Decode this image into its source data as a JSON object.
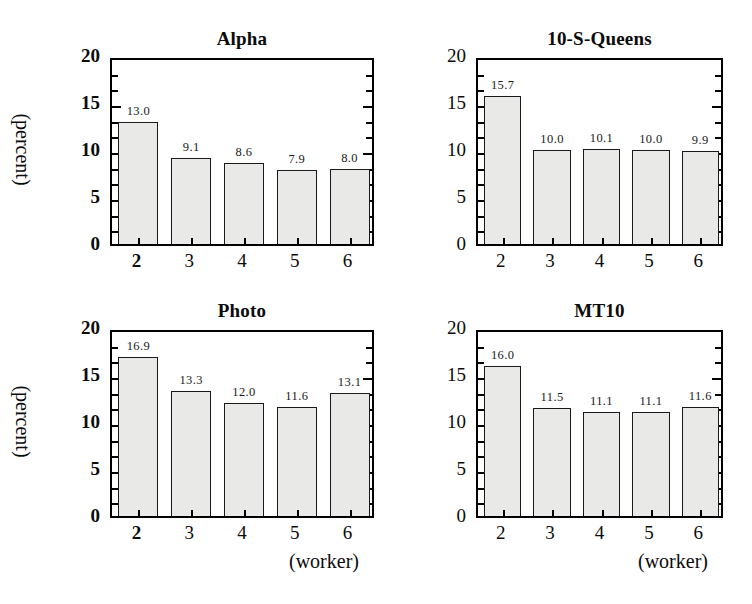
{
  "figure": {
    "background": "#ffffff",
    "bar_fill": "#e9e9e7",
    "bar_stroke": "#1a1a1a",
    "frame_color": "#000000",
    "text_color": "#0b0b0b"
  },
  "axis": {
    "y_title": "(percent)",
    "x_title": "(worker)",
    "y_ticks": [
      "0",
      "5",
      "10",
      "15",
      "20"
    ],
    "y_min": 0,
    "y_max": 20,
    "x_ticks": [
      "2",
      "3",
      "4",
      "5",
      "6"
    ]
  },
  "chart_data": [
    {
      "type": "bar",
      "title": "Alpha",
      "xlabel": "(worker)",
      "ylabel": "(percent)",
      "categories": [
        "2",
        "3",
        "4",
        "5",
        "6"
      ],
      "values": [
        13.0,
        9.1,
        8.6,
        7.9,
        8.0
      ],
      "labels": [
        "13.0",
        "9.1",
        "8.6",
        "7.9",
        "8.0"
      ],
      "ylim": [
        0,
        20
      ],
      "yticks": [
        0,
        5,
        10,
        15,
        20
      ],
      "grid": false,
      "legend": "none",
      "bold_xticks": [
        "2"
      ],
      "bold_yticks": true
    },
    {
      "type": "bar",
      "title": "10-S-Queens",
      "xlabel": "(worker)",
      "ylabel": "(percent)",
      "categories": [
        "2",
        "3",
        "4",
        "5",
        "6"
      ],
      "values": [
        15.7,
        10.0,
        10.1,
        10.0,
        9.9
      ],
      "labels": [
        "15.7",
        "10.0",
        "10.1",
        "10.0",
        "9.9"
      ],
      "ylim": [
        0,
        20
      ],
      "yticks": [
        0,
        5,
        10,
        15,
        20
      ],
      "grid": false,
      "legend": "none",
      "bold_xticks": [],
      "bold_yticks": false
    },
    {
      "type": "bar",
      "title": "Photo",
      "xlabel": "(worker)",
      "ylabel": "(percent)",
      "categories": [
        "2",
        "3",
        "4",
        "5",
        "6"
      ],
      "values": [
        16.9,
        13.3,
        12.0,
        11.6,
        13.1
      ],
      "labels": [
        "16.9",
        "13.3",
        "12.0",
        "11.6",
        "13.1"
      ],
      "ylim": [
        0,
        20
      ],
      "yticks": [
        0,
        5,
        10,
        15,
        20
      ],
      "grid": false,
      "legend": "none",
      "bold_xticks": [
        "2"
      ],
      "bold_yticks": true
    },
    {
      "type": "bar",
      "title": "MT10",
      "xlabel": "(worker)",
      "ylabel": "(percent)",
      "categories": [
        "2",
        "3",
        "4",
        "5",
        "6"
      ],
      "values": [
        16.0,
        11.5,
        11.1,
        11.1,
        11.6
      ],
      "labels": [
        "16.0",
        "11.5",
        "11.1",
        "11.1",
        "11.6"
      ],
      "ylim": [
        0,
        20
      ],
      "yticks": [
        0,
        5,
        10,
        15,
        20
      ],
      "grid": false,
      "legend": "none",
      "bold_xticks": [],
      "bold_yticks": false
    }
  ]
}
